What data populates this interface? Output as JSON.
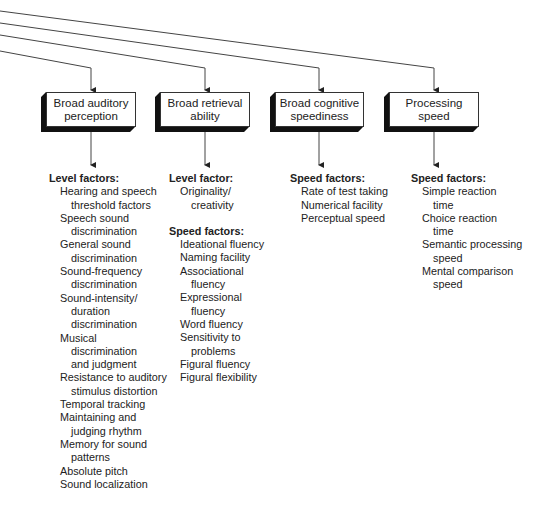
{
  "diagram": {
    "nodes": [
      {
        "id": "auditory",
        "label": "Broad auditory\nperception"
      },
      {
        "id": "retrieval",
        "label": "Broad retrieval\nability"
      },
      {
        "id": "cognitive",
        "label": "Broad cognitive\nspeediness"
      },
      {
        "id": "processing",
        "label": "Processing\nspeed"
      }
    ],
    "columns": [
      {
        "groups": [
          {
            "heading": "Level factors:",
            "items": [
              [
                "Hearing and speech",
                "threshold factors"
              ],
              [
                "Speech sound",
                "discrimination"
              ],
              [
                "General sound",
                "discrimination"
              ],
              [
                "Sound-frequency",
                "discrimination"
              ],
              [
                "Sound-intensity/",
                "duration",
                "discrimination"
              ],
              [
                "Musical",
                "discrimination",
                "and judgment"
              ],
              [
                "Resistance to auditory",
                "stimulus distortion"
              ],
              [
                "Temporal tracking"
              ],
              [
                "Maintaining and",
                "judging rhythm"
              ],
              [
                "Memory for sound",
                "patterns"
              ],
              [
                "Absolute pitch"
              ],
              [
                "Sound localization"
              ]
            ]
          }
        ]
      },
      {
        "groups": [
          {
            "heading": "Level factor:",
            "items": [
              [
                "Originality/",
                "creativity"
              ]
            ]
          },
          {
            "heading": "Speed factors:",
            "items": [
              [
                "Ideational fluency"
              ],
              [
                "Naming facility"
              ],
              [
                "Associational",
                "fluency"
              ],
              [
                "Expressional",
                "fluency"
              ],
              [
                "Word fluency"
              ],
              [
                "Sensitivity to",
                "problems"
              ],
              [
                "Figural fluency"
              ],
              [
                "Figural flexibility"
              ]
            ]
          }
        ]
      },
      {
        "groups": [
          {
            "heading": "Speed factors:",
            "items": [
              [
                "Rate of test taking"
              ],
              [
                "Numerical facility"
              ],
              [
                "Perceptual speed"
              ]
            ]
          }
        ]
      },
      {
        "groups": [
          {
            "heading": "Speed factors:",
            "items": [
              [
                "Simple reaction",
                "time"
              ],
              [
                "Choice reaction",
                "time"
              ],
              [
                "Semantic processing",
                "speed"
              ],
              [
                "Mental comparison",
                "speed"
              ]
            ]
          }
        ]
      }
    ]
  }
}
